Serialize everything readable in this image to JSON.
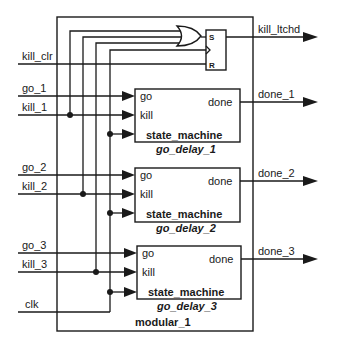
{
  "diagram": {
    "top_module": "modular_1",
    "inputs": {
      "kill_clr": "kill_clr",
      "go_1": "go_1",
      "kill_1": "kill_1",
      "go_2": "go_2",
      "kill_2": "kill_2",
      "go_3": "go_3",
      "kill_3": "kill_3",
      "clk": "clk"
    },
    "outputs": {
      "kill_ltchd": "kill_ltchd",
      "done_1": "done_1",
      "done_2": "done_2",
      "done_3": "done_3"
    },
    "flipflop": {
      "set": "S",
      "reset": "R"
    },
    "instances": [
      {
        "type": "state_machine",
        "name": "go_delay_1",
        "port_go": "go",
        "port_kill": "kill",
        "port_done": "done"
      },
      {
        "type": "state_machine",
        "name": "go_delay_2",
        "port_go": "go",
        "port_kill": "kill",
        "port_done": "done"
      },
      {
        "type": "state_machine",
        "name": "go_delay_3",
        "port_go": "go",
        "port_kill": "kill",
        "port_done": "done"
      }
    ]
  }
}
